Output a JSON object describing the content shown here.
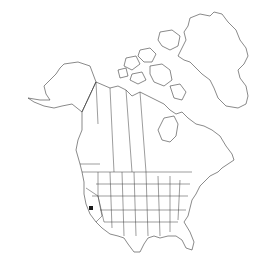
{
  "map": {
    "region": "North America",
    "style": "outline map with state and province borders",
    "colors": {
      "background": "#ffffff",
      "outline": "#3a3a3a",
      "marker": "#1a1a1a"
    },
    "markers": [
      {
        "type": "occurrence-dot",
        "region": "California",
        "x": 91,
        "y": 208
      }
    ]
  }
}
